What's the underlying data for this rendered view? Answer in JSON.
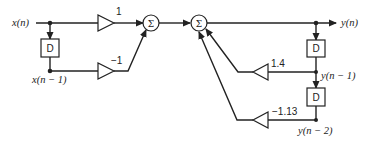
{
  "diagram": {
    "title": "",
    "type": "signal-flow block diagram (IIR filter, direct form I)",
    "signals": {
      "input": "x(n)",
      "input_delayed": "x(n − 1)",
      "output": "y(n)",
      "output_delayed_1": "y(n − 1)",
      "output_delayed_2": "y(n − 2)"
    },
    "delays": [
      "D",
      "D",
      "D"
    ],
    "gains": {
      "forward_0": "1",
      "forward_1": "−1",
      "feedback_1": "1.4",
      "feedback_2": "−1.13"
    },
    "summers": [
      "Σ",
      "Σ"
    ],
    "nodes": [
      {
        "id": "x_n",
        "label": "x(n)"
      },
      {
        "id": "delay_x",
        "label": "D"
      },
      {
        "id": "x_n1",
        "label": "x(n − 1)"
      },
      {
        "id": "gain_b0",
        "label": "1"
      },
      {
        "id": "gain_b1",
        "label": "−1"
      },
      {
        "id": "sum1",
        "label": "Σ"
      },
      {
        "id": "sum2",
        "label": "Σ"
      },
      {
        "id": "y_n",
        "label": "y(n)"
      },
      {
        "id": "delay_y1",
        "label": "D"
      },
      {
        "id": "y_n1",
        "label": "y(n − 1)"
      },
      {
        "id": "delay_y2",
        "label": "D"
      },
      {
        "id": "y_n2",
        "label": "y(n − 2)"
      },
      {
        "id": "gain_a1",
        "label": "1.4"
      },
      {
        "id": "gain_a2",
        "label": "−1.13"
      }
    ],
    "edges": [
      [
        "x_n",
        "gain_b0"
      ],
      [
        "x_n",
        "delay_x"
      ],
      [
        "delay_x",
        "gain_b1"
      ],
      [
        "gain_b0",
        "sum1"
      ],
      [
        "gain_b1",
        "sum1"
      ],
      [
        "sum1",
        "sum2"
      ],
      [
        "sum2",
        "y_n"
      ],
      [
        "y_n",
        "delay_y1"
      ],
      [
        "delay_y1",
        "gain_a1"
      ],
      [
        "delay_y1",
        "delay_y2"
      ],
      [
        "delay_y2",
        "gain_a2"
      ],
      [
        "gain_a1",
        "sum2"
      ],
      [
        "gain_a2",
        "sum2"
      ]
    ]
  }
}
